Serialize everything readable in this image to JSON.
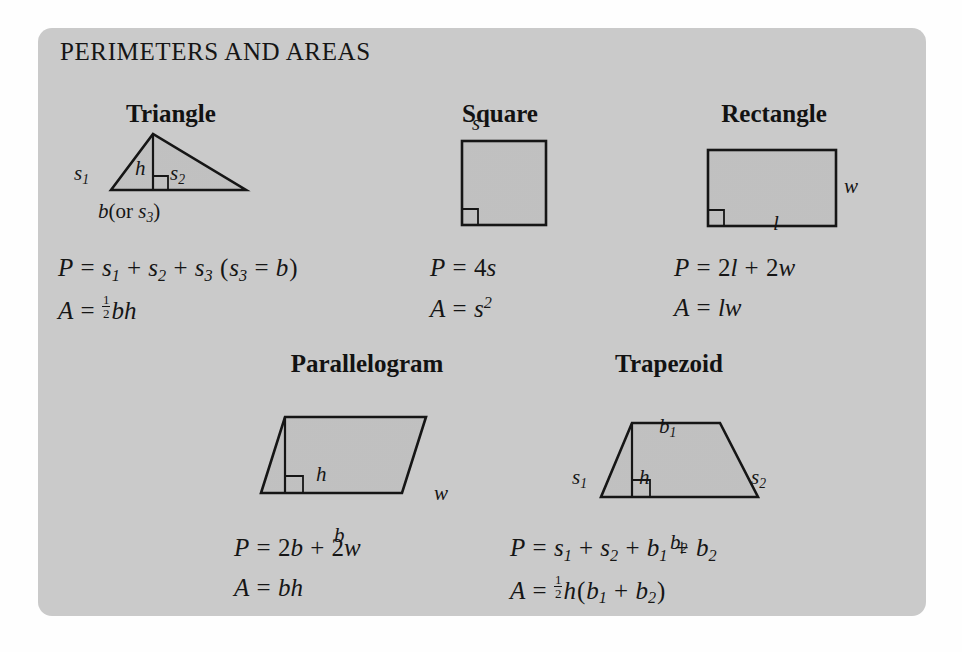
{
  "card": {
    "title": "PERIMETERS AND AREAS",
    "background_color": "#cdcdcd",
    "figure_fill_color": "#c3c3c3",
    "ink_color": "#111111"
  },
  "shapes": [
    {
      "name": "Triangle",
      "title": "Triangle",
      "labels": {
        "side1": "s",
        "side1_sub": "1",
        "side2": "s",
        "side2_sub": "2",
        "height": "h",
        "base_prefix": "b",
        "base_paren_open": "(or ",
        "base_alt": "s",
        "base_alt_sub": "3",
        "base_paren_close": ")"
      },
      "perimeter_label": "P",
      "area_label": "A",
      "perimeter_text": "P = s1 + s2 + s3 (s3 = b)",
      "area_text": "A = 1/2 bh"
    },
    {
      "name": "Square",
      "title": "Square",
      "labels": {
        "side": "s"
      },
      "perimeter_text": "P = 4s",
      "area_text": "A = s2"
    },
    {
      "name": "Rectangle",
      "title": "Rectangle",
      "labels": {
        "width": "w",
        "length": "l"
      },
      "perimeter_text": "P = 2l + 2w",
      "area_text": "A = lw"
    },
    {
      "name": "Parallelogram",
      "title": "Parallelogram",
      "labels": {
        "height": "h",
        "width": "w",
        "base": "b"
      },
      "perimeter_text": "P = 2b + 2w",
      "area_text": "A = bh"
    },
    {
      "name": "Trapezoid",
      "title": "Trapezoid",
      "labels": {
        "base1": "b",
        "base1_sub": "1",
        "base2": "b",
        "base2_sub": "2",
        "side1": "s",
        "side1_sub": "1",
        "side2": "s",
        "side2_sub": "2",
        "height": "h"
      },
      "perimeter_text": "P = s1 + s2 + b1 + b2",
      "area_text": "A = 1/2 h(b1 + b2)"
    }
  ],
  "glyphs": {
    "P": "P",
    "A": "A",
    "equals": "=",
    "plus": "+",
    "paren_open": "(",
    "paren_close": ")",
    "or_text": "(or ",
    "two": "2",
    "four": "4",
    "one": "1",
    "s": "s",
    "b": "b",
    "h": "h",
    "w": "w",
    "l": "l"
  }
}
